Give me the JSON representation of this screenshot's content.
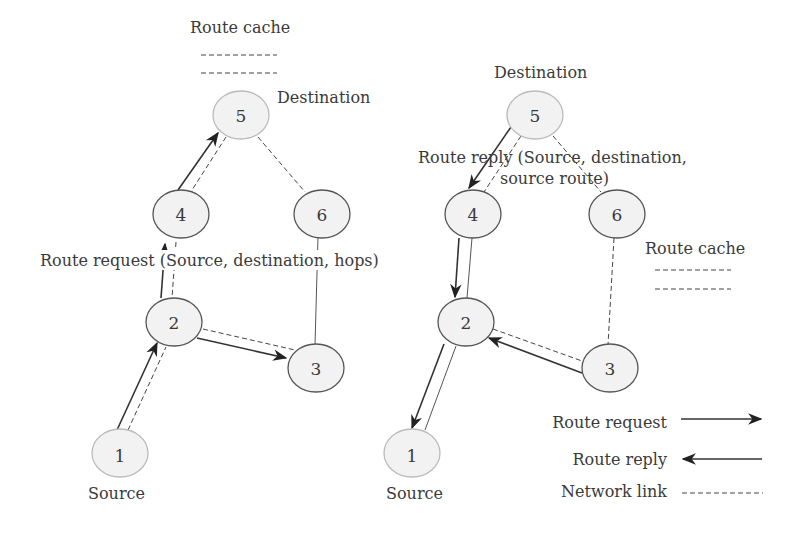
{
  "left_panel": {
    "route_cache_label": "Route cache",
    "destination_label": "Destination",
    "source_label": "Source",
    "route_request_label": "Route request (Source, destination, hops)",
    "nodes": [
      {
        "id": "1",
        "label": "1"
      },
      {
        "id": "2",
        "label": "2"
      },
      {
        "id": "3",
        "label": "3"
      },
      {
        "id": "4",
        "label": "4"
      },
      {
        "id": "5",
        "label": "5"
      },
      {
        "id": "6",
        "label": "6"
      }
    ]
  },
  "right_panel": {
    "destination_label": "Destination",
    "source_label": "Source",
    "route_reply_label_line1": "Route reply (Source, destination,",
    "route_reply_label_line2": "source route)",
    "route_cache_label": "Route cache",
    "nodes": [
      {
        "id": "1",
        "label": "1"
      },
      {
        "id": "2",
        "label": "2"
      },
      {
        "id": "3",
        "label": "3"
      },
      {
        "id": "4",
        "label": "4"
      },
      {
        "id": "5",
        "label": "5"
      },
      {
        "id": "6",
        "label": "6"
      }
    ]
  },
  "legend": {
    "route_request": "Route request",
    "route_reply": "Route reply",
    "network_link": "Network link"
  }
}
